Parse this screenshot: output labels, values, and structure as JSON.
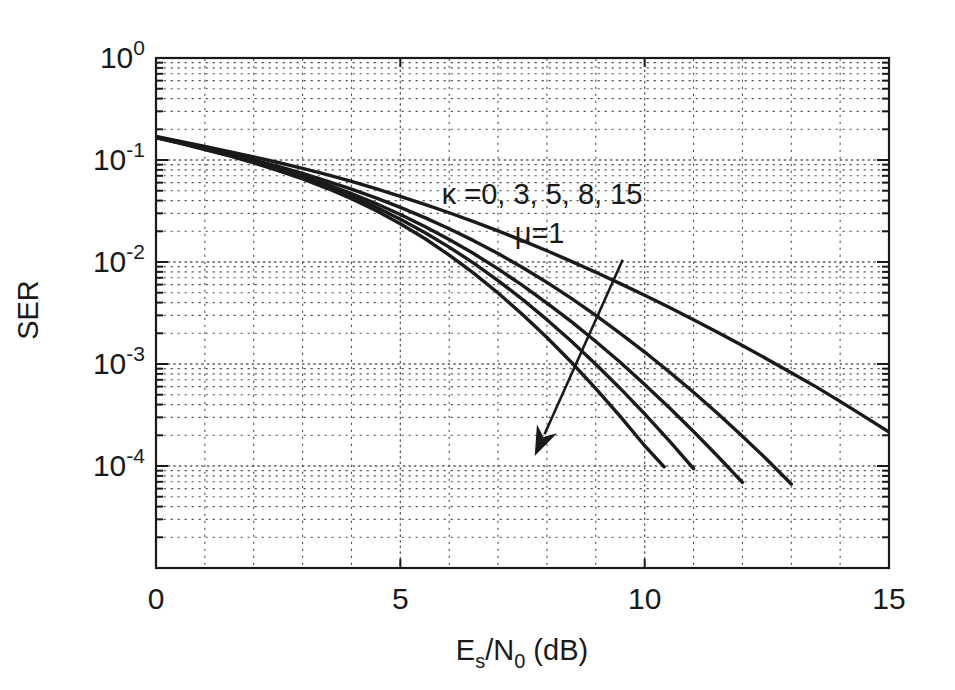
{
  "figure": {
    "width": 955,
    "height": 690,
    "background": "#ffffff",
    "line_color": "#1a1a1a",
    "grid_color": "#555555",
    "axis_color": "#1a1a1a"
  },
  "chart_data": {
    "type": "line",
    "title": "",
    "xlabel": "E_s/N_0 (dB)",
    "xlabel_parts": {
      "base1": "E",
      "sub1": "s",
      "slash": "/",
      "base2": "N",
      "sub2": "0",
      "unit": " (dB)"
    },
    "ylabel": "SER",
    "xlim": [
      0,
      15
    ],
    "ylim": [
      1e-05,
      1
    ],
    "xscale": "linear",
    "yscale": "log",
    "grid": true,
    "grid_style": "dotted",
    "legend": "none",
    "xticks": [
      0,
      5,
      10,
      15
    ],
    "xtick_labels": [
      "0",
      "5",
      "10",
      "15"
    ],
    "yticks": [
      1,
      0.1,
      0.01,
      0.001,
      0.0001
    ],
    "ytick_labels": [
      "10^0",
      "10^-1",
      "10^-2",
      "10^-3",
      "10^-4"
    ],
    "ytick_mantissa": [
      "10",
      "10",
      "10",
      "10",
      "10"
    ],
    "ytick_exponents": [
      "0",
      "-1",
      "-2",
      "-3",
      "-4"
    ],
    "annotations": [
      {
        "name": "kappa-values",
        "text": "κ =0, 3, 5, 8, 15",
        "x": 7.9,
        "y": 0.037
      },
      {
        "name": "mu-value",
        "text": "μ=1",
        "x": 7.85,
        "y": 0.0155
      }
    ],
    "arrow": {
      "name": "increasing-kappa-arrow",
      "from": {
        "x": 9.55,
        "y": 0.0105
      },
      "to": {
        "x": 7.75,
        "y": 0.000125
      },
      "meaning": "direction of increasing kappa"
    },
    "series": [
      {
        "name": "kappa = 0",
        "kappa": 0,
        "mu": 1,
        "x": [
          0,
          0.5,
          1,
          1.5,
          2,
          2.5,
          3,
          3.5,
          4,
          4.5,
          5,
          5.5,
          6,
          6.5,
          7,
          7.5,
          8,
          8.5,
          9,
          9.5,
          10,
          10.5,
          11,
          11.5,
          12,
          12.5,
          13,
          13.5,
          14,
          14.5,
          15
        ],
        "y": [
          0.17,
          0.152,
          0.136,
          0.121,
          0.107,
          0.0945,
          0.0828,
          0.0718,
          0.0616,
          0.0524,
          0.0441,
          0.0368,
          0.0304,
          0.0249,
          0.0202,
          0.0162,
          0.0129,
          0.01015,
          0.00793,
          0.00614,
          0.00472,
          0.0036,
          0.00272,
          0.00204,
          0.00152,
          0.00112,
          0.00082,
          0.0006,
          0.00043,
          0.000305,
          0.000215
        ]
      },
      {
        "name": "kappa = 3",
        "kappa": 3,
        "mu": 1,
        "x": [
          0,
          0.5,
          1,
          1.5,
          2,
          2.5,
          3,
          3.5,
          4,
          4.5,
          5,
          5.5,
          6,
          6.5,
          7,
          7.5,
          8,
          8.5,
          9,
          9.5,
          10,
          10.5,
          11,
          11.5,
          12,
          12.5,
          13
        ],
        "y": [
          0.168,
          0.149,
          0.132,
          0.1155,
          0.1005,
          0.0865,
          0.0738,
          0.0622,
          0.0518,
          0.0425,
          0.0343,
          0.0272,
          0.0212,
          0.0162,
          0.0121,
          0.00884,
          0.00631,
          0.0044,
          0.003,
          0.002,
          0.00131,
          0.00084,
          0.000528,
          0.000325,
          0.000196,
          0.000116,
          6.65e-05
        ]
      },
      {
        "name": "kappa = 5",
        "kappa": 5,
        "mu": 1,
        "x": [
          0,
          0.5,
          1,
          1.5,
          2,
          2.5,
          3,
          3.5,
          4,
          4.5,
          5,
          5.5,
          6,
          6.5,
          7,
          7.5,
          8,
          8.5,
          9,
          9.5,
          10,
          10.5,
          11,
          11.5,
          12
        ],
        "y": [
          0.167,
          0.1475,
          0.1295,
          0.1128,
          0.0972,
          0.0828,
          0.0696,
          0.0576,
          0.0469,
          0.0374,
          0.0292,
          0.0223,
          0.0166,
          0.0121,
          0.00856,
          0.0059,
          0.00396,
          0.0026,
          0.00166,
          0.00104,
          0.00063,
          0.000375,
          0.000218,
          0.000124,
          6.91e-05
        ]
      },
      {
        "name": "kappa = 8",
        "kappa": 8,
        "mu": 1,
        "x": [
          0,
          0.5,
          1,
          1.5,
          2,
          2.5,
          3,
          3.5,
          4,
          4.5,
          5,
          5.5,
          6,
          6.5,
          7,
          7.5,
          8,
          8.5,
          9,
          9.5,
          10,
          10.5,
          11
        ],
        "y": [
          0.166,
          0.1465,
          0.128,
          0.111,
          0.0952,
          0.0806,
          0.0672,
          0.055,
          0.0441,
          0.0345,
          0.0263,
          0.0195,
          0.014,
          0.00975,
          0.00658,
          0.0043,
          0.00272,
          0.00167,
          0.000995,
          0.000576,
          0.000324,
          0.000177,
          9.43e-05
        ]
      },
      {
        "name": "kappa = 15",
        "kappa": 15,
        "mu": 1,
        "x": [
          0,
          0.5,
          1,
          1.5,
          2,
          2.5,
          3,
          3.5,
          4,
          4.5,
          5,
          5.5,
          6,
          6.5,
          7,
          7.5,
          8,
          8.5,
          9,
          9.5,
          10,
          10.4
        ],
        "y": [
          0.165,
          0.1455,
          0.1268,
          0.1095,
          0.0935,
          0.0787,
          0.0652,
          0.0528,
          0.0417,
          0.032,
          0.0237,
          0.017,
          0.0117,
          0.00777,
          0.00497,
          0.00306,
          0.00182,
          0.00104,
          0.000574,
          0.000307,
          0.000158,
          9.82e-05
        ]
      }
    ]
  }
}
